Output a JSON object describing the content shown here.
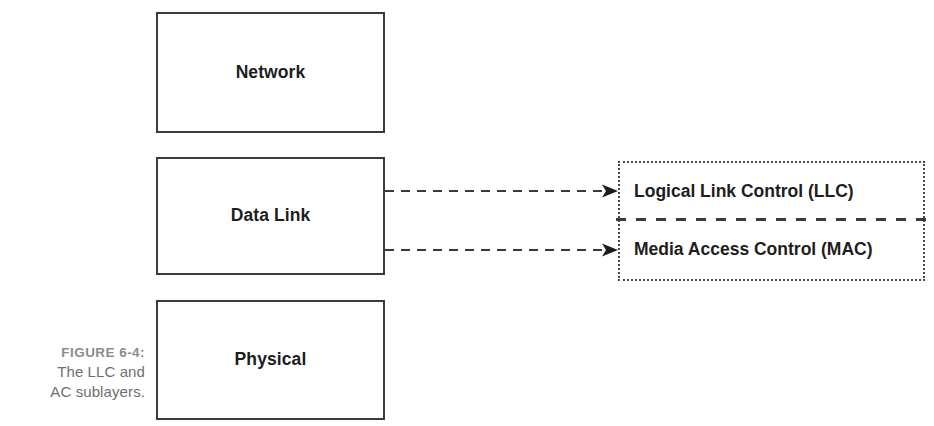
{
  "figure": {
    "caption_number": "FIGURE 6-4:",
    "caption_line_1": "The LLC and",
    "caption_line_2": "AC sublayers.",
    "caption_color": "#7f7f7f"
  },
  "stack": {
    "title": "OSI lower layers",
    "layers": [
      {
        "id": "network",
        "label": "Network"
      },
      {
        "id": "datalink",
        "label": "Data Link"
      },
      {
        "id": "physical",
        "label": "Physical"
      }
    ]
  },
  "sublayers": {
    "panel_name": "Data Link sublayers",
    "items": [
      {
        "id": "llc",
        "label": "Logical Link Control (LLC)"
      },
      {
        "id": "mac",
        "label": "Media Access Control (MAC)"
      }
    ],
    "divider_style": "dashed"
  },
  "connectors": [
    {
      "id": "arrow-llc",
      "from": "Data Link",
      "to": "Logical Link Control (LLC)",
      "style": "dashed",
      "arrowhead": "filled"
    },
    {
      "id": "arrow-mac",
      "from": "Data Link",
      "to": "Media Access Control (MAC)",
      "style": "dashed",
      "arrowhead": "filled"
    }
  ],
  "colors": {
    "box_border": "#3b3b3b",
    "panel_border": "#4a4a4a",
    "text": "#1d1d1d",
    "connector": "#3b3b3b",
    "background": "#ffffff"
  }
}
